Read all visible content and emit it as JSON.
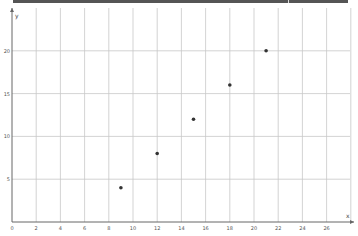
{
  "chart_data": {
    "type": "scatter",
    "title": "",
    "xlabel": "x",
    "ylabel": "y",
    "x": [
      9,
      12,
      15,
      18,
      21
    ],
    "y": [
      4,
      8,
      12,
      16,
      20
    ],
    "series": [
      {
        "name": "points",
        "x": [
          9,
          12,
          15,
          18,
          21
        ],
        "y": [
          4,
          8,
          12,
          16,
          20
        ],
        "color": "#333333"
      }
    ],
    "xlim": [
      0,
      28.5
    ],
    "ylim": [
      0,
      25
    ],
    "x_ticks": [
      0,
      2,
      4,
      6,
      8,
      10,
      12,
      14,
      16,
      18,
      20,
      22,
      24,
      26
    ],
    "y_ticks": [
      5,
      10,
      15,
      20
    ],
    "x_grid_step": 2,
    "y_grid_step": 5,
    "grid": true,
    "legend": "none"
  },
  "colors": {
    "grid": "#c8c8c8",
    "axis": "#666666",
    "point": "#333333",
    "topbar": "#555555"
  }
}
